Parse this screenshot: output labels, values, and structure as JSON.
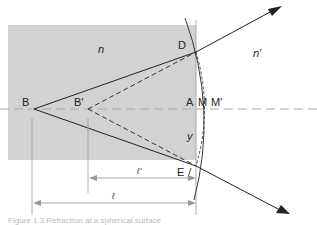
{
  "diagram": {
    "colors": {
      "medium_fill": "#d2d2d2",
      "line": "#222222",
      "axis_dash": "#a8a8a8",
      "dimension_line": "#999999"
    },
    "media": {
      "left_index": "n",
      "right_index": "n'"
    },
    "points": {
      "B": "B",
      "B_prime": "B'",
      "D": "D",
      "E": "E",
      "A": "A",
      "M": "M",
      "M_prime": "M'"
    },
    "height_label": "y",
    "dimensions": {
      "l_prime": "ℓ'",
      "l": "ℓ"
    },
    "caption": "Figure 1.3 Refraction at a spherical surface"
  }
}
